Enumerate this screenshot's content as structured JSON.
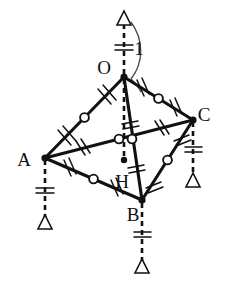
{
  "figure": {
    "type": "geometry-diagram",
    "stroke_color": "#111111",
    "background_color": "#ffffff",
    "vertices": [
      {
        "id": "O",
        "label": "O",
        "x": 124,
        "y": 77,
        "label_x": 107,
        "label_y": 74
      },
      {
        "id": "A",
        "label": "A",
        "x": 45,
        "y": 158,
        "label_x": 22,
        "label_y": 166
      },
      {
        "id": "B",
        "label": "B",
        "x": 142,
        "y": 200,
        "label_x": 130,
        "label_y": 219
      },
      {
        "id": "C",
        "label": "C",
        "x": 193,
        "y": 120,
        "label_x": 200,
        "label_y": 118
      },
      {
        "id": "H",
        "label": "H",
        "x": 124,
        "y": 160,
        "label_x": 115,
        "label_y": 186
      }
    ],
    "edges": [
      {
        "id": "OA",
        "from": "O",
        "to": "A",
        "marks": "double-hash",
        "midpoint_circle": true
      },
      {
        "id": "OC",
        "from": "O",
        "to": "C",
        "marks": "double-hash",
        "midpoint_circle": true
      },
      {
        "id": "OB",
        "from": "O",
        "to": "B",
        "marks": "double-hash",
        "midpoint_circle": false
      },
      {
        "id": "AC",
        "from": "A",
        "to": "C",
        "marks": "double-hash",
        "midpoint_circle": true
      },
      {
        "id": "AB",
        "from": "A",
        "to": "B",
        "marks": "double-hash",
        "midpoint_circle": true
      },
      {
        "id": "BC",
        "from": "B",
        "to": "C",
        "marks": "double-hash",
        "midpoint_circle": true
      }
    ],
    "altitude": {
      "id": "OH",
      "from": "O",
      "to": "H",
      "style": "dashed",
      "foot_marked": true
    },
    "measurement": {
      "label": "1",
      "label_x": 136,
      "label_y": 49,
      "tick_style": "double-hash",
      "arrow_style": "hollow-triangle-up",
      "from_y": 77,
      "to_y": 12,
      "x": 124,
      "description": "vertical dashed measure from O upward, length 1"
    },
    "supports": [
      {
        "id": "support-A",
        "vertex": "A",
        "x": 45,
        "y_top": 158,
        "y_bottom": 228,
        "tick_style": "double-hash"
      },
      {
        "id": "support-B",
        "vertex": "B",
        "x": 142,
        "y_top": 200,
        "y_bottom": 272,
        "tick_style": "double-hash"
      },
      {
        "id": "support-C",
        "vertex": "C",
        "x": 193,
        "y_top": 120,
        "y_bottom": 186,
        "tick_style": "double-hash"
      }
    ],
    "arc": {
      "id": "curve-arc",
      "description": "curved arc from top arrow down to O"
    }
  }
}
